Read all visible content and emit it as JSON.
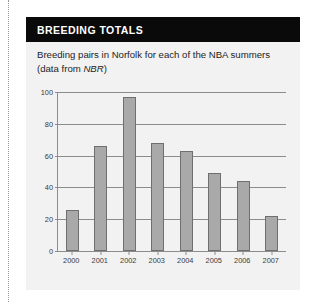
{
  "panel": {
    "title": "BREEDING TOTALS",
    "subtitle_line1": "Breeding pairs in Norfolk for each of the NBA summers",
    "subtitle_line2_pre": "(data from ",
    "subtitle_source": "NBR",
    "subtitle_line2_post": ")"
  },
  "colors": {
    "header_bg": "#0a0a0a",
    "header_text": "#ffffff",
    "panel_bg": "#f2f2f2",
    "bar_fill": "#a9a9a9",
    "bar_stroke": "#6f6f6f",
    "axis": "#8c8c8c",
    "grid": "#8c8c8c",
    "tick_text": "#3a3a3a"
  },
  "chart_data": {
    "type": "bar",
    "title": "BREEDING TOTALS",
    "subtitle": "Breeding pairs in Norfolk for each of the NBA summers (data from NBR)",
    "xlabel": "",
    "ylabel": "",
    "categories": [
      "2000",
      "2001",
      "2002",
      "2003",
      "2004",
      "2005",
      "2006",
      "2007"
    ],
    "values": [
      26,
      66,
      97,
      68,
      63,
      49,
      44,
      22
    ],
    "ylim": [
      0,
      100
    ],
    "yticks": [
      0,
      20,
      40,
      60,
      80,
      100
    ],
    "ytick_labels": [
      "0",
      "20",
      "40",
      "60",
      "80",
      "100"
    ],
    "grid": "horizontal",
    "legend": "none",
    "series": [
      {
        "name": "Breeding pairs in Norfolk",
        "values": [
          26,
          66,
          97,
          68,
          63,
          49,
          44,
          22
        ]
      }
    ]
  }
}
